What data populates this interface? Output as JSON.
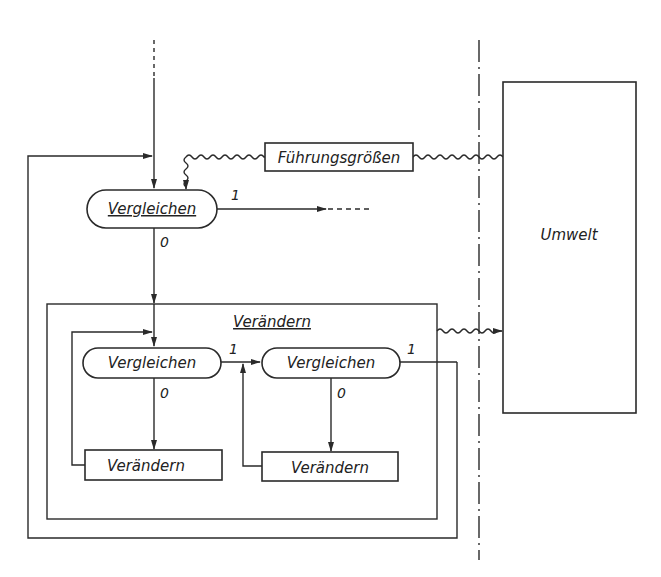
{
  "diagram": {
    "type": "control-loop block diagram",
    "nodes": {
      "top_compare": {
        "label": "Vergleichen",
        "shape": "rounded",
        "underlined": true
      },
      "reference": {
        "label": "Führungsgrößen",
        "shape": "rect"
      },
      "environment": {
        "label": "Umwelt",
        "shape": "rect"
      },
      "change_group": {
        "label": "Verändern",
        "shape": "rect-group",
        "underlined": true
      },
      "inner_compare_1": {
        "label": "Vergleichen",
        "shape": "rounded"
      },
      "inner_change_1": {
        "label": "Verändern",
        "shape": "rect"
      },
      "inner_compare_2": {
        "label": "Vergleichen",
        "shape": "rounded"
      },
      "inner_change_2": {
        "label": "Verändern",
        "shape": "rect"
      }
    },
    "edge_labels": {
      "top_yes": "1",
      "top_no": "0",
      "inner1_yes": "1",
      "inner1_no": "0",
      "inner2_yes": "1",
      "inner2_no": "0"
    },
    "edges": [
      {
        "from": "input (dashed)",
        "to": "top_compare"
      },
      {
        "from": "reference",
        "to": "top_compare",
        "style": "wavy"
      },
      {
        "from": "environment",
        "to": "reference",
        "style": "wavy"
      },
      {
        "from": "top_compare",
        "to": "output (dashed)",
        "label": "1"
      },
      {
        "from": "top_compare",
        "to": "change_group",
        "label": "0"
      },
      {
        "from": "change_group",
        "to": "environment",
        "style": "wavy"
      },
      {
        "from": "inner_compare_1",
        "to": "inner_change_1",
        "label": "0"
      },
      {
        "from": "inner_change_1",
        "to": "inner_compare_1"
      },
      {
        "from": "inner_compare_1",
        "to": "inner_compare_2",
        "label": "1"
      },
      {
        "from": "inner_compare_2",
        "to": "inner_change_2",
        "label": "0"
      },
      {
        "from": "inner_change_2",
        "to": "inner_compare_2"
      },
      {
        "from": "inner_compare_2",
        "to": "top_compare",
        "label": "1"
      }
    ],
    "boundary": {
      "style": "dash-dot vertical line"
    }
  }
}
